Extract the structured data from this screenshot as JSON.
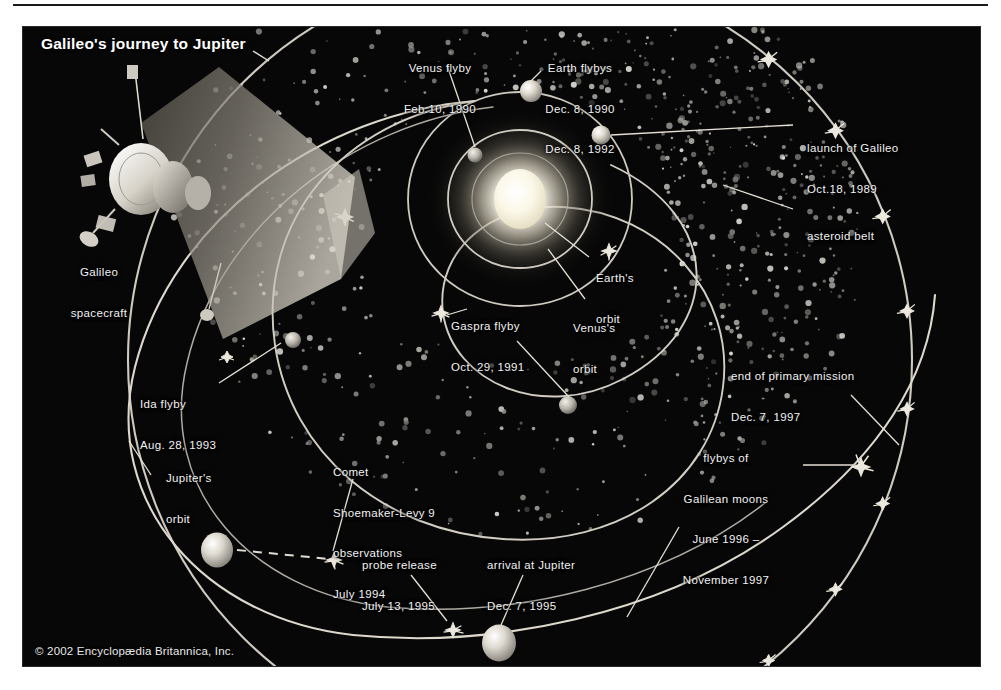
{
  "figure": {
    "title": "Galileo's journey to Jupiter",
    "copyright": "© 2002 Encyclopædia Britannica, Inc.",
    "background_color": "#050505",
    "line_color": "#d8d8d8",
    "text_color": "#f2f2f2"
  },
  "chart_data": {
    "type": "diagram",
    "title": "Galileo's journey to Jupiter",
    "credit": "© 2002 Encyclopædia Britannica, Inc.",
    "orbits": [
      {
        "name": "Venus's orbit",
        "label": "Venus's\norbit"
      },
      {
        "name": "Earth's orbit",
        "label": "Earth's\norbit"
      },
      {
        "name": "Jupiter's orbit",
        "label": "Jupiter's\norbit"
      },
      {
        "name": "asteroid belt",
        "label": "asteroid belt"
      }
    ],
    "events": [
      {
        "id": "launch",
        "label": "launch of Galileo",
        "date": "Oct.18, 1989"
      },
      {
        "id": "venus-flyby",
        "label": "Venus flyby",
        "date": "Feb.10, 1990"
      },
      {
        "id": "earth-flyby-1",
        "label": "Earth flybys",
        "date": "Dec. 8, 1990"
      },
      {
        "id": "earth-flyby-2",
        "label": "Earth flybys",
        "date": "Dec. 8, 1992"
      },
      {
        "id": "gaspra-flyby",
        "label": "Gaspra flyby",
        "date": "Oct. 29, 1991"
      },
      {
        "id": "ida-flyby",
        "label": "Ida flyby",
        "date": "Aug. 28, 1993"
      },
      {
        "id": "comet-sl9",
        "label": "Comet Shoemaker-Levy 9 observations",
        "date": "July 1994"
      },
      {
        "id": "probe-release",
        "label": "probe release",
        "date": "July 13, 1995"
      },
      {
        "id": "arrival",
        "label": "arrival at Jupiter",
        "date": "Dec. 7, 1995"
      },
      {
        "id": "galilean-flybys",
        "label": "flybys of Galilean moons",
        "date": "June 1996 – November 1997"
      },
      {
        "id": "end-mission",
        "label": "end of primary mission",
        "date": "Dec. 7, 1997"
      }
    ],
    "bodies": [
      "Sun",
      "Venus",
      "Earth",
      "Jupiter",
      "Gaspra",
      "Ida"
    ],
    "spacecraft": "Galileo spacecraft",
    "galilean_flyby_marker_count": 11
  },
  "labels": {
    "title": "Galileo's journey to Jupiter",
    "spacecraft_l1": "Galileo",
    "spacecraft_l2": "spacecraft",
    "venus_flyby_l1": "Venus flyby",
    "venus_flyby_l2": "Feb.10, 1990",
    "earth_flybys_l1": "Earth flybys",
    "earth_flybys_l2": "Dec. 8, 1990",
    "earth_flybys_l3": "Dec. 8, 1992",
    "launch_l1": "launch of Galileo",
    "launch_l2": "Oct.18, 1989",
    "asteroid_belt": "asteroid belt",
    "earths_orbit_l1": "Earth's",
    "earths_orbit_l2": "orbit",
    "venuss_orbit_l1": "Venus's",
    "venuss_orbit_l2": "orbit",
    "gaspra_l1": "Gaspra flyby",
    "gaspra_l2": "Oct. 29, 1991",
    "ida_l1": "Ida flyby",
    "ida_l2": "Aug. 28, 1993",
    "jupiters_orbit_l1": "Jupiter's",
    "jupiters_orbit_l2": "orbit",
    "comet_l1": "Comet",
    "comet_l2": "Shoemaker-Levy 9",
    "comet_l3": "observations",
    "comet_l4": "July 1994",
    "probe_l1": "probe release",
    "probe_l2": "July 13, 1995",
    "arrival_l1": "arrival at Jupiter",
    "arrival_l2": "Dec. 7, 1995",
    "end_mission_l1": "end of primary mission",
    "end_mission_l2": "Dec. 7, 1997",
    "galilean_l1": "flybys of",
    "galilean_l2": "Galilean moons",
    "galilean_l3": "June 1996 –",
    "galilean_l4": "November 1997",
    "copyright": "© 2002 Encyclopædia Britannica, Inc."
  }
}
